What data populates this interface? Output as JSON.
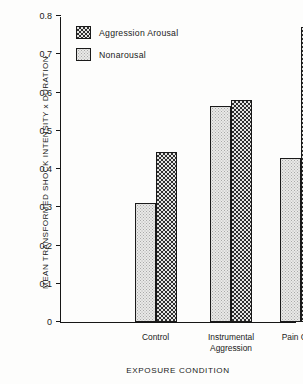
{
  "chart_data": {
    "type": "bar",
    "title": "",
    "xlabel": "EXPOSURE CONDITION",
    "ylabel": "MEAN TRANSFORMED SHOCK INTENSITY x DURATION",
    "categories": [
      "Control",
      "Instrumental Aggression",
      "Pain Cues"
    ],
    "category_lines": [
      [
        "Control"
      ],
      [
        "Instrumental",
        "Aggression"
      ],
      [
        "Pain Cues"
      ]
    ],
    "series": [
      {
        "name": "Nonarousal",
        "values": [
          0.31,
          0.565,
          0.43
        ],
        "pattern": "dotted",
        "fill": "#e9e9e7"
      },
      {
        "name": "Aggression Arousal",
        "values": [
          0.445,
          0.58,
          0.77
        ],
        "pattern": "cross-hatch",
        "fill": "#2e2e2e"
      }
    ],
    "series_order_in_group": [
      "Nonarousal",
      "Aggression Arousal"
    ],
    "ylim": [
      0,
      0.8
    ],
    "yticks": [
      "0",
      "0.1",
      "0.2",
      "0.3",
      "0.4",
      "0.5",
      "0.6",
      "0.7",
      "0.8"
    ],
    "ytick_values": [
      0,
      0.1,
      0.2,
      0.3,
      0.4,
      0.5,
      0.6,
      0.7,
      0.8
    ],
    "grid": false,
    "legend_position": "top-left-inside",
    "legend": [
      {
        "label": "Aggression Arousal"
      },
      {
        "label": "Nonarousal"
      }
    ],
    "axis_color": "#161616",
    "background": "#fdfdfc"
  }
}
